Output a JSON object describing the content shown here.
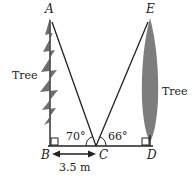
{
  "diagram": {
    "points": {
      "A": "A",
      "B": "B",
      "C": "C",
      "D": "D",
      "E": "E"
    },
    "left_tree_label": "Tree",
    "right_tree_label": "Tree",
    "angle_ACB": "70°",
    "angle_ECD": "66°",
    "distance_BC": "3.5 m"
  }
}
